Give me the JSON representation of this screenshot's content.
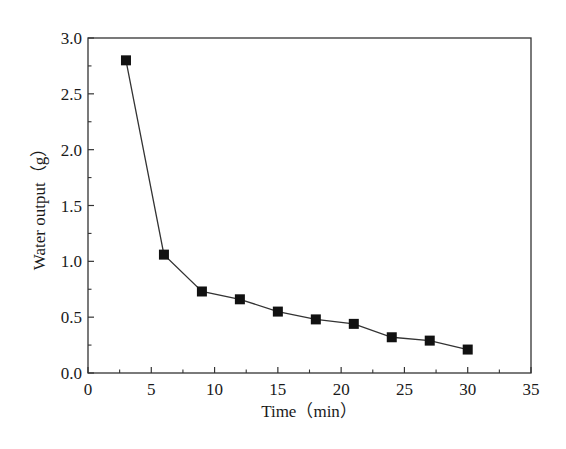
{
  "chart_data": {
    "type": "line",
    "title": "",
    "xlabel": "Time (min)",
    "ylabel": "Water output (g)",
    "xlim": [
      0,
      35
    ],
    "ylim": [
      0,
      3.0
    ],
    "x_ticks": [
      0,
      5,
      10,
      15,
      20,
      25,
      30,
      35
    ],
    "x_tick_labels": [
      "0",
      "5",
      "10",
      "15",
      "20",
      "25",
      "30",
      "35"
    ],
    "y_ticks": [
      0.0,
      0.5,
      1.0,
      1.5,
      2.0,
      2.5,
      3.0
    ],
    "y_tick_labels": [
      "0.0",
      "0.5",
      "1.0",
      "1.5",
      "2.0",
      "2.5",
      "3.0"
    ],
    "grid": false,
    "legend": null,
    "series": [
      {
        "name": "Water output",
        "marker": "filled-square",
        "color": "#111111",
        "x": [
          3,
          6,
          9,
          12,
          15,
          18,
          21,
          24,
          27,
          30
        ],
        "values": [
          2.8,
          1.06,
          0.73,
          0.66,
          0.55,
          0.48,
          0.44,
          0.32,
          0.29,
          0.21
        ]
      }
    ]
  },
  "labels": {
    "x_axis": "Time（min）",
    "y_axis": "Water output（g）"
  },
  "colors": {
    "axis": "#333333",
    "line": "#333333",
    "marker": "#111111",
    "background": "#ffffff"
  }
}
